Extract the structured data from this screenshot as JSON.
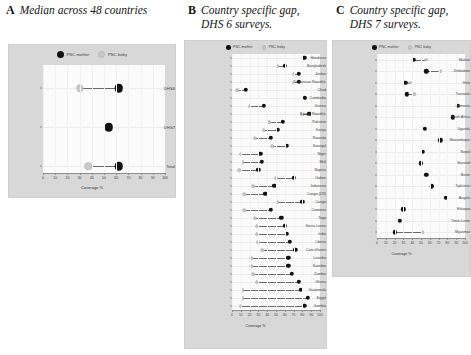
{
  "legend": {
    "mother_label": "PNC mother",
    "baby_label": "PNC baby",
    "mother_color": "#111111",
    "baby_color": "#c9c9c9"
  },
  "panels": [
    {
      "letter": "A",
      "title": "Median across 48 countries",
      "xaxis_title": "Coverage %"
    },
    {
      "letter": "B",
      "title": "Country specific gap,\nDHS 6 surveys.",
      "xaxis_title": "Coverage %"
    },
    {
      "letter": "C",
      "title": "Country specific gap,\nDHS 7 surveys.",
      "xaxis_title": "Coverage %"
    }
  ],
  "chart_data": [
    {
      "type": "scatter",
      "panel": "A",
      "title": "Median across 48 countries",
      "xlabel": "Coverage %",
      "ylabel": "",
      "xlim": [
        0,
        100
      ],
      "xticks": [
        0,
        10,
        20,
        30,
        40,
        50,
        60,
        70,
        80,
        90,
        100
      ],
      "grid": true,
      "legend_position": "top-center",
      "categories": [
        "DHS6",
        "DHS7",
        "Total"
      ],
      "series": [
        {
          "name": "PNC mother",
          "values": [
            62,
            54,
            62
          ]
        },
        {
          "name": "PNC baby",
          "values": [
            30,
            null,
            37
          ]
        }
      ]
    },
    {
      "type": "scatter",
      "panel": "B",
      "title": "Country specific gap, DHS 6 surveys.",
      "xlabel": "Coverage %",
      "ylabel": "",
      "xlim": [
        0,
        100
      ],
      "xticks": [
        0,
        10,
        20,
        30,
        40,
        50,
        60,
        70,
        80,
        90,
        100
      ],
      "grid": true,
      "legend_position": "top-center",
      "categories": [
        "Honduras",
        "Bangladesh",
        "Jordan",
        "Dominican Republic",
        "Chad",
        "Cambodia",
        "Guinea",
        "Kyrgyz Republic",
        "Pakistan",
        "Kenya",
        "Rwanda",
        "Senegal",
        "Niger",
        "Mali",
        "Nigeria",
        "Gabon",
        "Indonesia",
        "Congo (DR)",
        "Congo",
        "Comoros",
        "Togo",
        "Sierra Leone",
        "India",
        "Liberia",
        "Cote d'Ivoire",
        "Lesotho",
        "Namibia",
        "Zambia",
        "Ghana",
        "Guatemala",
        "Egypt",
        "Gambia"
      ],
      "series": [
        {
          "name": "PNC mother",
          "values": [
            82,
            60,
            76,
            76,
            16,
            83,
            36,
            88,
            58,
            52,
            44,
            62,
            32,
            34,
            30,
            70,
            48,
            38,
            80,
            44,
            56,
            60,
            62,
            66,
            72,
            64,
            64,
            68,
            76,
            78,
            86,
            82
          ]
        },
        {
          "name": "PNC baby",
          "values": [
            82,
            52,
            70,
            70,
            6,
            83,
            20,
            80,
            42,
            36,
            26,
            46,
            10,
            12,
            8,
            50,
            24,
            14,
            52,
            14,
            26,
            28,
            28,
            30,
            34,
            22,
            22,
            24,
            28,
            12,
            12,
            10
          ]
        }
      ]
    },
    {
      "type": "scatter",
      "panel": "C",
      "title": "Country specific gap, DHS 7 surveys.",
      "xlabel": "Coverage %",
      "ylabel": "",
      "xlim": [
        0,
        100
      ],
      "xticks": [
        0,
        10,
        20,
        30,
        40,
        50,
        60,
        70,
        80,
        90,
        100
      ],
      "grid": true,
      "legend_position": "top-center",
      "categories": [
        "Malawi",
        "Zimbabwe",
        "Haiti",
        "Tanzania",
        "Armenia",
        "South Africa",
        "Uganda",
        "Mozambique",
        "Nepal",
        "Burundi",
        "Benin",
        "Tajikistan",
        "Angola",
        "Ethiopia",
        "Timor-Leste",
        "Myanmar"
      ],
      "series": [
        {
          "name": "PNC mother",
          "values": [
            42,
            56,
            32,
            34,
            92,
            86,
            54,
            72,
            52,
            50,
            56,
            62,
            78,
            30,
            26,
            20
          ]
        },
        {
          "name": "PNC baby",
          "values": [
            56,
            72,
            38,
            42,
            92,
            86,
            54,
            72,
            52,
            50,
            56,
            62,
            78,
            30,
            26,
            52
          ]
        }
      ]
    }
  ]
}
